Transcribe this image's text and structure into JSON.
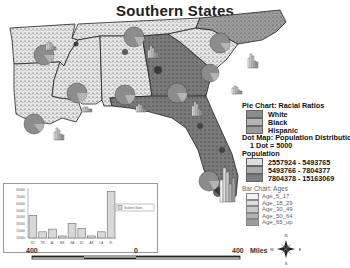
{
  "title": "Southern States",
  "legend": {
    "pie_title": "Pie Chart: Racial Ratios",
    "pie_items": [
      {
        "label": "White",
        "color": "#8c8c8c"
      },
      {
        "label": "Black",
        "color": "#b4b4b4"
      },
      {
        "label": "Hispanic",
        "color": "#9a9a9a"
      }
    ],
    "dot_title": "Dot Map: Population Distribution",
    "dot_note": "1 Dot = 5000",
    "pop_title": "Population",
    "pop_items": [
      {
        "label": "2557924 - 5493765",
        "color": "#dedede"
      },
      {
        "label": "5493766 - 7804377",
        "color": "#aaaaaa"
      },
      {
        "label": "7804378 - 15163069",
        "color": "#7e7e7e"
      }
    ],
    "bar_title": "Bar Chart: Ages",
    "bar_items": [
      {
        "label": "Age_5_17",
        "color": "#f4f4f4"
      },
      {
        "label": "Age_18_29",
        "color": "#dcdcdc"
      },
      {
        "label": "Age_30_49",
        "color": "#c8c8c8"
      },
      {
        "label": "Age_50_64",
        "color": "#b2b2b2"
      },
      {
        "label": "Age_65_up",
        "color": "#9c9c9c"
      }
    ]
  },
  "scale_bar": {
    "left_label": "400",
    "mid_label": "0",
    "right_label": "400",
    "unit": "Miles"
  },
  "compass": {
    "n": "N",
    "s": "S",
    "e": "E",
    "w": "W"
  },
  "chart_data": {
    "type": "bar",
    "title": "",
    "categories": [
      "NC",
      "TN",
      "AL",
      "MS",
      "GA",
      "SC",
      "AR",
      "LA",
      "FL"
    ],
    "series": [
      {
        "name": "Southern States",
        "values": [
          430000,
          190000,
          230000,
          130000,
          310000,
          240000,
          130000,
          190000,
          780000
        ]
      }
    ],
    "yticks": [
      "100000",
      "200000",
      "300000",
      "400000",
      "500000",
      "600000",
      "700000",
      "800000"
    ],
    "ylim": [
      100000,
      800000
    ],
    "xlabel": "",
    "ylabel": "",
    "legend": [
      "Southern States"
    ],
    "legend_position": "right"
  }
}
